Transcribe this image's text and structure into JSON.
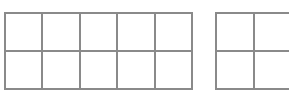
{
  "diagram": {
    "grids": [
      {
        "name": "grid-2x5",
        "rows": 2,
        "cols": 5,
        "x": 4,
        "y": 12,
        "cell_w": 37.4,
        "cell_h": 38
      },
      {
        "name": "grid-2x2",
        "rows": 2,
        "cols": 2,
        "x": 215,
        "y": 12,
        "cell_w": 37.5,
        "cell_h": 38
      }
    ],
    "line_color": "#8a8a8a",
    "background": "#ffffff"
  }
}
